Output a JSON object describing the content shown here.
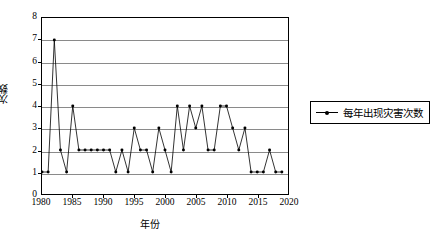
{
  "chart_data": {
    "type": "line",
    "title": "",
    "xlabel": "年份",
    "ylabel": "次数",
    "xlim": [
      1980,
      2020
    ],
    "ylim": [
      0,
      8
    ],
    "grid": true,
    "legend_position": "right",
    "x_ticks": [
      "1980",
      "1985",
      "1990",
      "1995",
      "2000",
      "2005",
      "2010",
      "2015",
      "2020"
    ],
    "y_ticks": [
      "0",
      "1",
      "2",
      "3",
      "4",
      "5",
      "6",
      "7",
      "8"
    ],
    "series": [
      {
        "name": "每年出现灾害次数",
        "color": "#000000",
        "marker": "dot",
        "x": [
          1980,
          1981,
          1982,
          1983,
          1984,
          1985,
          1986,
          1987,
          1988,
          1989,
          1990,
          1991,
          1992,
          1993,
          1994,
          1995,
          1996,
          1997,
          1998,
          1999,
          2000,
          2001,
          2002,
          2003,
          2004,
          2005,
          2006,
          2007,
          2008,
          2009,
          2010,
          2011,
          2012,
          2013,
          2014,
          2015,
          2016,
          2017,
          2018,
          2019
        ],
        "values": [
          1,
          1,
          7,
          2,
          1,
          4,
          2,
          2,
          2,
          2,
          2,
          2,
          1,
          2,
          1,
          3,
          2,
          2,
          1,
          3,
          2,
          1,
          4,
          2,
          4,
          3,
          4,
          2,
          2,
          4,
          4,
          3,
          2,
          3,
          1,
          1,
          1,
          2,
          1,
          1
        ]
      }
    ]
  },
  "legend": {
    "entry_label": "每年出现灾害次数"
  },
  "axes": {
    "y_title": "次数",
    "x_title": "年份"
  }
}
